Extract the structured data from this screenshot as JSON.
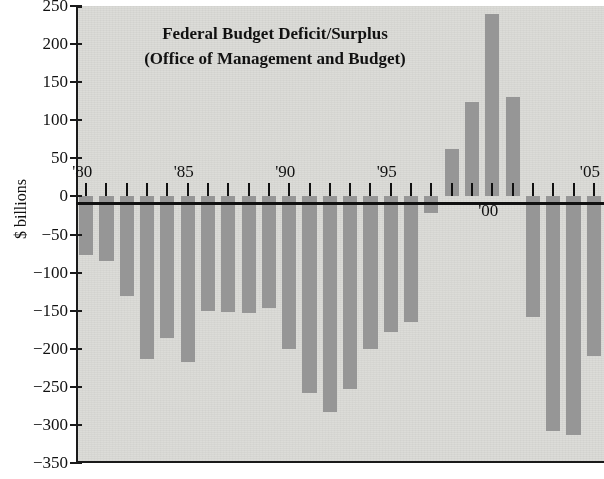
{
  "chart_data": {
    "type": "bar",
    "title": "Federal Budget Deficit/Surplus",
    "subtitle": "(Office of Management and Budget)",
    "title_lines": [
      "Federal Budget Deficit/Surplus",
      "(Office of Management and Budget)"
    ],
    "xlabel": "",
    "ylabel": "$ billions",
    "ylim": [
      -350,
      250
    ],
    "ytick_labels": [
      "250",
      "200",
      "150",
      "100",
      "50",
      "0",
      "−50",
      "−100",
      "−150",
      "−200",
      "−250",
      "−300",
      "−350"
    ],
    "ytick_values": [
      250,
      200,
      150,
      100,
      50,
      0,
      -50,
      -100,
      -150,
      -200,
      -250,
      -300,
      -350
    ],
    "xtick_labels": [
      "'80",
      "'85",
      "'90",
      "'95",
      "'00",
      "'05"
    ],
    "xtick_label_years": [
      1980,
      1985,
      1990,
      1995,
      2000,
      2005
    ],
    "grid": false,
    "legend": "none",
    "bar_color": "#969696",
    "plot_background": "#dcdcd8",
    "axis_color": "#111111",
    "categories": [
      1980,
      1981,
      1982,
      1983,
      1984,
      1985,
      1986,
      1987,
      1988,
      1989,
      1990,
      1991,
      1992,
      1993,
      1994,
      1995,
      1996,
      1997,
      1998,
      1999,
      2000,
      2001,
      2002,
      2003,
      2004,
      2005
    ],
    "values": [
      -77,
      -85,
      -131,
      -213,
      -186,
      -217,
      -150,
      -152,
      -153,
      -147,
      -200,
      -258,
      -283,
      -253,
      -200,
      -178,
      -165,
      -22,
      62,
      124,
      240,
      131,
      -158,
      -308,
      -313,
      -209
    ],
    "series": [
      {
        "name": "Federal budget deficit/surplus",
        "units": "$ billions",
        "values": [
          -77,
          -85,
          -131,
          -213,
          -186,
          -217,
          -150,
          -152,
          -153,
          -147,
          -200,
          -258,
          -283,
          -253,
          -200,
          -178,
          -165,
          -22,
          62,
          124,
          240,
          131,
          -158,
          -308,
          -313,
          -209
        ]
      }
    ]
  },
  "meta": {
    "chart_name": "federal-budget-deficit-surplus-chart"
  }
}
